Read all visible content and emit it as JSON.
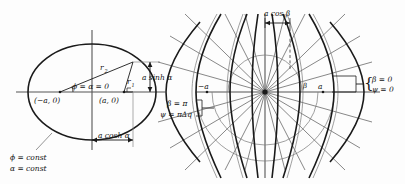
{
  "figure": {
    "background_color": "#fdfdfd",
    "stroke_color": "#1a1a1a",
    "thin_stroke_color": "#666666",
    "width": 405,
    "height": 184
  },
  "left_panel": {
    "name": "confocal-ellipse-diagram",
    "labels": {
      "focus_left": "(−a, 0)",
      "focus_right": "(a, 0)",
      "radius_1": "r",
      "radius_1_sub": "1",
      "radius_2": "r",
      "radius_2_sub": "2",
      "angle_origin": "ϕ = α = 0",
      "vertical_extent": "a sinh α",
      "horizontal_extent": "a cosh α",
      "const_phi": "ϕ = const",
      "const_alpha": "α = const"
    }
  },
  "middle_labels": {
    "name": "branch-cut-labels",
    "beta": "β = π",
    "psi": "ψ = πΔq"
  },
  "right_panel": {
    "name": "confocal-hyperbola-diagram",
    "labels": {
      "projection": "a cos β",
      "focus_left": "−a",
      "focus_right": "a",
      "beta_axis": "β",
      "brace_beta": "β = 0",
      "brace_psi": "ψ = 0"
    }
  }
}
